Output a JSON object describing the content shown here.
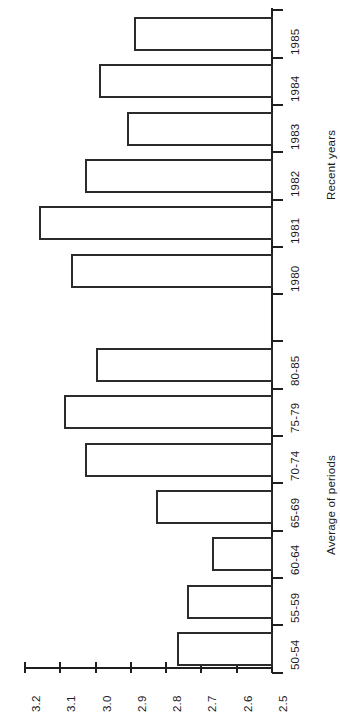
{
  "chart_data": {
    "type": "bar",
    "orientation": "horizontal",
    "title": "",
    "subtitle": "",
    "xlabel": "",
    "ylabel": "",
    "grid": false,
    "legend": null,
    "value_axis": {
      "min": 2.5,
      "max": 3.2,
      "direction": "descending-left-to-right",
      "tick_labels": [
        "3.2",
        "3.1",
        "3.0",
        "2.9",
        "2.8",
        "2.7",
        "2.6",
        "2.5"
      ],
      "tick_values": [
        3.2,
        3.1,
        3.0,
        2.9,
        2.8,
        2.7,
        2.6,
        2.5
      ]
    },
    "groups": [
      {
        "name": "Recent years",
        "categories": [
          "1985",
          "1984",
          "1983",
          "1982",
          "1981",
          "1980"
        ],
        "values": [
          2.89,
          2.99,
          2.91,
          3.03,
          3.16,
          3.07
        ]
      },
      {
        "name": "Average of periods",
        "categories": [
          "80-85",
          "75-79",
          "70-74",
          "65-69",
          "60-64",
          "55-59",
          "50-54"
        ],
        "values": [
          3.0,
          3.09,
          3.03,
          2.83,
          2.67,
          2.74,
          2.77
        ]
      }
    ],
    "categories": [
      "1985",
      "1984",
      "1983",
      "1982",
      "1981",
      "1980",
      "80-85",
      "75-79",
      "70-74",
      "65-69",
      "60-64",
      "55-59",
      "50-54"
    ],
    "values": [
      2.89,
      2.99,
      2.91,
      3.03,
      3.16,
      3.07,
      3.0,
      3.09,
      3.03,
      2.83,
      2.67,
      2.74,
      2.77
    ]
  },
  "axis_titles": {
    "recent_years": "Recent years",
    "average_of_periods": "Average of periods"
  }
}
